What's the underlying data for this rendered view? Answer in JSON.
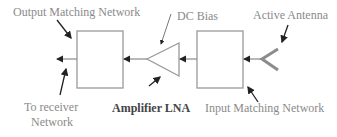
{
  "diagram": {
    "labels": {
      "output_matching": "Output Matching Network",
      "dc_bias": "DC Bias",
      "active_antenna": "Active Antenna",
      "to_receiver_line1": "To receiver",
      "to_receiver_line2": "Network",
      "amplifier": "Amplifier LNA",
      "input_matching": "Input Matching Network"
    },
    "colors": {
      "block_stroke": "#9a9a9a",
      "arrow": "#222222",
      "label_text": "#8a8a8a",
      "antenna": "#8c8c8c"
    },
    "blocks": [
      "Output Matching Network",
      "Amplifier LNA",
      "Input Matching Network",
      "Active Antenna"
    ]
  }
}
